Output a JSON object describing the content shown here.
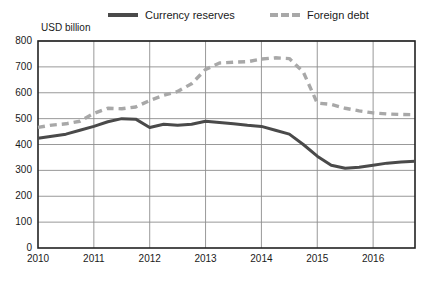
{
  "legend": {
    "items": [
      {
        "key": "reserves",
        "label": "Currency reserves",
        "style": "solid",
        "color": "#4a4a4a"
      },
      {
        "key": "debt",
        "label": "Foreign debt",
        "style": "dashed",
        "color": "#a8a8a8"
      }
    ]
  },
  "chart_data": {
    "type": "line",
    "title": "",
    "subtitle": "",
    "xlabel": "",
    "ylabel": "USD billion",
    "ylim": [
      0,
      800
    ],
    "xlim": [
      2010,
      2016.75
    ],
    "grid": true,
    "legend_position": "top",
    "yticks": [
      800,
      700,
      600,
      500,
      400,
      300,
      200,
      100,
      0
    ],
    "xticks": [
      "2010",
      "2011",
      "2012",
      "2013",
      "2014",
      "2015",
      "2016"
    ],
    "x": [
      2010.0,
      2010.25,
      2010.5,
      2010.75,
      2011.0,
      2011.25,
      2011.5,
      2011.75,
      2012.0,
      2012.25,
      2012.5,
      2012.75,
      2013.0,
      2013.25,
      2013.5,
      2013.75,
      2014.0,
      2014.25,
      2014.5,
      2014.75,
      2015.0,
      2015.25,
      2015.5,
      2015.75,
      2016.0,
      2016.25,
      2016.5,
      2016.75
    ],
    "series": [
      {
        "name": "Currency reserves",
        "color": "#4a4a4a",
        "style": "solid",
        "values": [
          424,
          432,
          440,
          455,
          470,
          488,
          500,
          498,
          466,
          478,
          474,
          478,
          490,
          485,
          480,
          474,
          470,
          455,
          440,
          400,
          355,
          320,
          308,
          312,
          320,
          328,
          332,
          335
        ]
      },
      {
        "name": "Foreign debt",
        "color": "#a8a8a8",
        "style": "dashed",
        "values": [
          466,
          475,
          480,
          490,
          520,
          540,
          538,
          545,
          570,
          590,
          605,
          635,
          690,
          715,
          718,
          720,
          730,
          735,
          732,
          680,
          560,
          555,
          540,
          530,
          522,
          518,
          516,
          515
        ]
      }
    ]
  }
}
